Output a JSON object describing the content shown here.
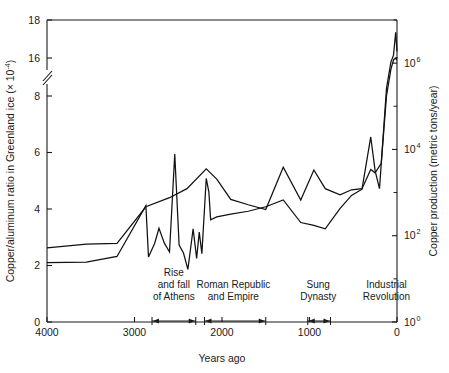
{
  "chart_data": {
    "type": "line",
    "title": "",
    "subtitle": "",
    "xlabel": "Years ago",
    "ylabel": "Copper/aluminum ratio in Greenland ice (× 10⁻⁴)",
    "ylabel_main": "Copper/aluminum ratio in Greenland ice (× 10",
    "ylabel_sup": "-4",
    "ylabel_tail": ")",
    "y2label": "Copper production (metric tons/year)",
    "grid": false,
    "legend": "none",
    "xlim": [
      4000,
      0
    ],
    "x_reversed": true,
    "xticks": [
      4000,
      3000,
      2000,
      1000,
      0
    ],
    "xticklabels": [
      "4000",
      "3000",
      "2000",
      "1000",
      "0"
    ],
    "ylim": [
      0,
      18
    ],
    "y_axis_break": {
      "present": true,
      "between": [
        8,
        16
      ],
      "style": "double-slash"
    },
    "yticks": [
      0,
      2,
      4,
      6,
      8,
      16,
      18
    ],
    "yticklabels": [
      "0",
      "2",
      "4",
      "6",
      "8",
      "16",
      "18"
    ],
    "y2_scale": "log",
    "y2lim": [
      1,
      10000000
    ],
    "y2ticks": [
      1,
      100,
      10000,
      1000000
    ],
    "y2ticklabels": [
      "10⁰",
      "10²",
      "10⁴",
      "10⁶"
    ],
    "y2tick_bases": [
      "10",
      "10",
      "10",
      "10"
    ],
    "y2tick_exponents": [
      "0",
      "2",
      "4",
      "6"
    ],
    "series": [
      {
        "name": "Copper/aluminum ratio in Greenland ice",
        "axis": "left",
        "units": "× 10^-4",
        "points": [
          [
            4000,
            2.1
          ],
          [
            3550,
            2.12
          ],
          [
            3200,
            2.32
          ],
          [
            2870,
            4.12
          ],
          [
            2840,
            2.3
          ],
          [
            2770,
            2.78
          ],
          [
            2720,
            3.32
          ],
          [
            2660,
            2.8
          ],
          [
            2600,
            2.48
          ],
          [
            2540,
            5.95
          ],
          [
            2490,
            2.72
          ],
          [
            2440,
            2.44
          ],
          [
            2390,
            1.86
          ],
          [
            2330,
            3.3
          ],
          [
            2290,
            2.25
          ],
          [
            2260,
            3.18
          ],
          [
            2230,
            2.42
          ],
          [
            2180,
            5.08
          ],
          [
            2150,
            4.6
          ],
          [
            2130,
            3.62
          ],
          [
            2060,
            3.72
          ],
          [
            1900,
            3.82
          ],
          [
            1700,
            3.92
          ],
          [
            1500,
            4.08
          ],
          [
            1300,
            4.32
          ],
          [
            1100,
            3.52
          ],
          [
            950,
            3.42
          ],
          [
            820,
            3.3
          ],
          [
            650,
            4.02
          ],
          [
            520,
            4.48
          ],
          [
            400,
            4.7
          ],
          [
            300,
            6.55
          ],
          [
            250,
            5.35
          ],
          [
            200,
            4.72
          ],
          [
            120,
            9.6
          ],
          [
            70,
            15.1
          ],
          [
            40,
            16.15
          ],
          [
            15,
            17.35
          ],
          [
            0,
            16.35
          ]
        ]
      },
      {
        "name": "Copper production (metric tons/year)",
        "axis": "right",
        "units": "metric tons/year",
        "points": [
          [
            4000,
            2.62
          ],
          [
            3550,
            2.76
          ],
          [
            3200,
            2.78
          ],
          [
            2870,
            4.08
          ],
          [
            2600,
            4.4
          ],
          [
            2400,
            4.72
          ],
          [
            2180,
            5.42
          ],
          [
            2060,
            5.06
          ],
          [
            1900,
            4.34
          ],
          [
            1700,
            4.15
          ],
          [
            1500,
            3.98
          ],
          [
            1300,
            5.48
          ],
          [
            1100,
            4.32
          ],
          [
            950,
            5.38
          ],
          [
            820,
            4.72
          ],
          [
            650,
            4.5
          ],
          [
            520,
            4.68
          ],
          [
            400,
            4.72
          ],
          [
            300,
            5.4
          ],
          [
            250,
            5.28
          ],
          [
            180,
            5.62
          ],
          [
            120,
            8.0
          ],
          [
            70,
            13.6
          ],
          [
            40,
            15.55
          ],
          [
            20,
            16.0
          ],
          [
            8,
            15.7
          ],
          [
            0,
            16.05
          ]
        ]
      }
    ],
    "annotations": [
      {
        "id": "rise-and-fall-of-athens",
        "lines": [
          "Rise",
          "and fall",
          "of Athens"
        ],
        "text": "Rise and fall of Athens",
        "span_start": 2800,
        "span_end": 2300,
        "text_center": 2550
      },
      {
        "id": "roman-republic-and-empire",
        "lines": [
          "Roman Republic",
          "and Empire"
        ],
        "text": "Roman Republic and Empire",
        "span_start": 2200,
        "span_end": 1500,
        "text_center": 1870
      },
      {
        "id": "sung-dynasty",
        "lines": [
          "Sung",
          "Dynasty"
        ],
        "text": "Sung Dynasty",
        "span_start": 1020,
        "span_end": 760,
        "text_center": 900
      },
      {
        "id": "industrial-revolution",
        "lines": [
          "Industrial",
          "Revolution"
        ],
        "text": "Industrial Revolution",
        "span_start": null,
        "span_end": null,
        "text_center": 120
      }
    ],
    "colors": {
      "line": "#111111",
      "axis": "#1a1a1a",
      "background": "#ffffff",
      "text": "#1a1a1a"
    }
  }
}
